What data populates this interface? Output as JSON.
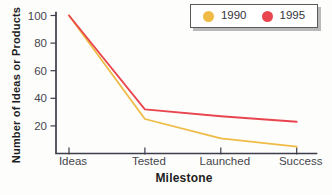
{
  "chart_data": {
    "type": "line",
    "categories": [
      "Ideas",
      "Tested",
      "Launched",
      "Success"
    ],
    "series": [
      {
        "name": "1990",
        "color": "#EFBB45",
        "values": [
          100,
          25,
          11,
          5
        ]
      },
      {
        "name": "1995",
        "color": "#E8454E",
        "values": [
          100,
          32,
          27,
          23
        ]
      }
    ],
    "xlabel": "Milestone",
    "ylabel": "Number of Ideas or Products",
    "ylim": [
      0,
      100
    ],
    "yticks": [
      20,
      40,
      60,
      80,
      100
    ],
    "grid": false,
    "legend_position": "top-right"
  },
  "colors": {
    "background": "#FDFDFB",
    "axis": "#3D3D4B",
    "text": "#46464E",
    "legend_border": "#5A5A5A",
    "legend_shadow": "#B9B9B9",
    "series_1990": "#EFBB45",
    "series_1995": "#E8454E"
  }
}
